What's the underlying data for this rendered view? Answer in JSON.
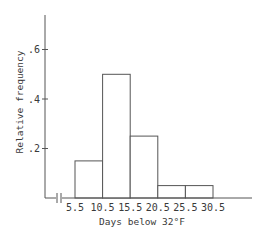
{
  "chart_data": {
    "type": "bar",
    "subtype": "histogram",
    "title": "",
    "xlabel": "Days below 32°F",
    "ylabel": "Relative frequency",
    "bin_edges": [
      5.5,
      10.5,
      15.5,
      20.5,
      25.5,
      30.5
    ],
    "categories": [
      "5.5-10.5",
      "10.5-15.5",
      "15.5-20.5",
      "20.5-25.5",
      "25.5-30.5"
    ],
    "values": [
      0.15,
      0.5,
      0.25,
      0.05,
      0.05
    ],
    "x_tick_labels": [
      "5.5",
      "10.5",
      "15.5",
      "20.5",
      "25.5",
      "30.5"
    ],
    "y_tick_labels": [
      ".2",
      ".4",
      ".6"
    ],
    "y_ticks": [
      0.2,
      0.4,
      0.6
    ],
    "ylim": [
      0,
      0.74
    ],
    "grid": false,
    "legend": null,
    "x_axis_break": true
  },
  "labels": {
    "xlabel": "Days below 32°F",
    "ylabel": "Relative frequency",
    "xticks": [
      "5.5",
      "10.5",
      "15.5",
      "20.5",
      "25.5",
      "30.5"
    ],
    "yticks": [
      ".2",
      ".4",
      ".6"
    ]
  },
  "colors": {
    "line": "#555555",
    "text": "#3a3a3a",
    "bar_fill": "#ffffff"
  }
}
